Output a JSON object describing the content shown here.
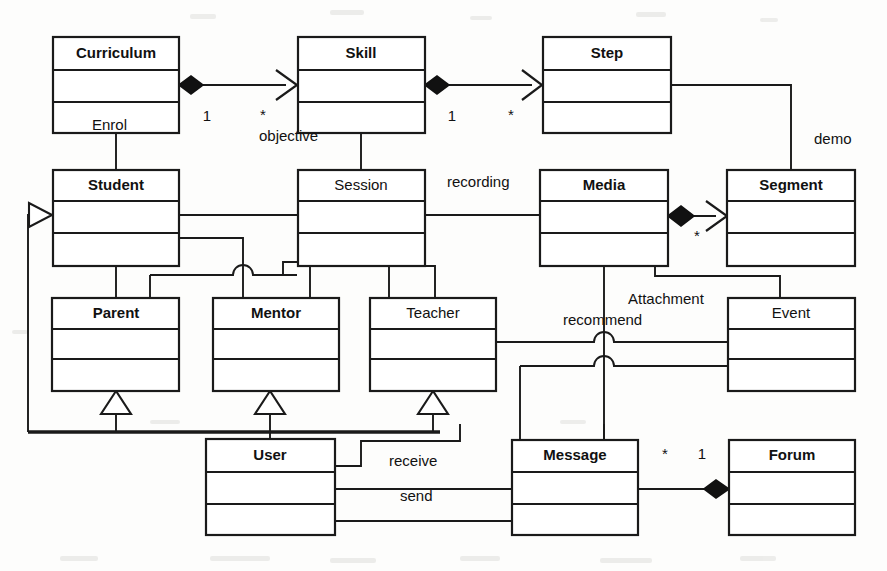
{
  "diagram": {
    "kind": "uml-class-diagram",
    "title": "",
    "canvas": {
      "width": 887,
      "height": 571
    },
    "colors": {
      "background": "#fdfdfc",
      "stroke": "#1a1a1a",
      "fill": "#ffffff",
      "text": "#111111"
    },
    "classes": [
      {
        "id": "curriculum",
        "name": "Curriculum",
        "bold": true,
        "x": 53,
        "y": 37,
        "w": 126,
        "h": 96
      },
      {
        "id": "skill",
        "name": "Skill",
        "bold": true,
        "x": 298,
        "y": 37,
        "w": 127,
        "h": 96
      },
      {
        "id": "step",
        "name": "Step",
        "bold": true,
        "x": 543,
        "y": 37,
        "w": 128,
        "h": 96
      },
      {
        "id": "student",
        "name": "Student",
        "bold": true,
        "x": 53,
        "y": 170,
        "w": 126,
        "h": 96
      },
      {
        "id": "session",
        "name": "Session",
        "bold": false,
        "x": 298,
        "y": 170,
        "w": 127,
        "h": 96
      },
      {
        "id": "media",
        "name": "Media",
        "bold": true,
        "x": 540,
        "y": 170,
        "w": 128,
        "h": 96
      },
      {
        "id": "segment",
        "name": "Segment",
        "bold": true,
        "x": 727,
        "y": 170,
        "w": 128,
        "h": 96
      },
      {
        "id": "parent",
        "name": "Parent",
        "bold": true,
        "x": 52,
        "y": 298,
        "w": 127,
        "h": 93
      },
      {
        "id": "mentor",
        "name": "Mentor",
        "bold": true,
        "x": 213,
        "y": 298,
        "w": 126,
        "h": 93
      },
      {
        "id": "teacher",
        "name": "Teacher",
        "bold": false,
        "x": 370,
        "y": 298,
        "w": 126,
        "h": 93
      },
      {
        "id": "event",
        "name": "Event",
        "bold": false,
        "x": 728,
        "y": 298,
        "w": 127,
        "h": 93
      },
      {
        "id": "user",
        "name": "User",
        "bold": true,
        "x": 206,
        "y": 439,
        "w": 129,
        "h": 96
      },
      {
        "id": "message",
        "name": "Message",
        "bold": true,
        "x": 512,
        "y": 440,
        "w": 126,
        "h": 95
      },
      {
        "id": "forum",
        "name": "Forum",
        "bold": true,
        "x": 729,
        "y": 440,
        "w": 126,
        "h": 95
      }
    ],
    "edge_labels": [
      {
        "id": "enrol",
        "text": "Enrol",
        "x": 92,
        "y": 126,
        "anchor": "start"
      },
      {
        "id": "objective",
        "text": "objective",
        "x": 259,
        "y": 137,
        "anchor": "start"
      },
      {
        "id": "recording",
        "text": "recording",
        "x": 447,
        "y": 183,
        "anchor": "start"
      },
      {
        "id": "demo",
        "text": "demo",
        "x": 814,
        "y": 140,
        "anchor": "start"
      },
      {
        "id": "attachment",
        "text": "Attachment",
        "x": 628,
        "y": 300,
        "anchor": "start"
      },
      {
        "id": "recommend",
        "text": "recommend",
        "x": 563,
        "y": 321,
        "anchor": "start"
      },
      {
        "id": "receive",
        "text": "receive",
        "x": 389,
        "y": 462,
        "anchor": "start"
      },
      {
        "id": "send",
        "text": "send",
        "x": 400,
        "y": 497,
        "anchor": "start"
      }
    ],
    "multiplicities": [
      {
        "id": "curriculum-skill-src",
        "text": "1",
        "x": 207,
        "y": 117
      },
      {
        "id": "curriculum-skill-tgt",
        "text": "*",
        "x": 263,
        "y": 116
      },
      {
        "id": "skill-step-src",
        "text": "1",
        "x": 452,
        "y": 117
      },
      {
        "id": "skill-step-tgt",
        "text": "*",
        "x": 511,
        "y": 116
      },
      {
        "id": "media-segment-tgt",
        "text": "*",
        "x": 697,
        "y": 237
      },
      {
        "id": "message-forum-src",
        "text": "*",
        "x": 665,
        "y": 455
      },
      {
        "id": "message-forum-tgt",
        "text": "1",
        "x": 702,
        "y": 455
      }
    ],
    "relations": [
      {
        "id": "curriculum-skill",
        "from": "curriculum",
        "to": "skill",
        "type": "aggregation-composition"
      },
      {
        "id": "skill-step",
        "from": "skill",
        "to": "step",
        "type": "aggregation-composition"
      },
      {
        "id": "media-segment",
        "from": "media",
        "to": "segment",
        "type": "aggregation-composition"
      },
      {
        "id": "message-forum",
        "from": "message",
        "to": "forum",
        "type": "aggregation-composition"
      },
      {
        "id": "curriculum-student",
        "from": "curriculum",
        "to": "student",
        "type": "association"
      },
      {
        "id": "skill-session",
        "from": "skill",
        "to": "session",
        "type": "association"
      },
      {
        "id": "student-session",
        "from": "student",
        "to": "session",
        "type": "association"
      },
      {
        "id": "session-media",
        "from": "session",
        "to": "media",
        "type": "association"
      },
      {
        "id": "step-segment",
        "from": "step",
        "to": "segment",
        "type": "association"
      },
      {
        "id": "student-parent",
        "from": "student",
        "to": "parent",
        "type": "association"
      },
      {
        "id": "student-mentor",
        "from": "student",
        "to": "mentor",
        "type": "association"
      },
      {
        "id": "session-mentor",
        "from": "session",
        "to": "mentor",
        "type": "association"
      },
      {
        "id": "session-teacher",
        "from": "session",
        "to": "teacher",
        "type": "association"
      },
      {
        "id": "media-event",
        "from": "media",
        "to": "event",
        "type": "association"
      },
      {
        "id": "media-message",
        "from": "media",
        "to": "message",
        "type": "association"
      },
      {
        "id": "teacher-event",
        "from": "teacher",
        "to": "event",
        "type": "association"
      },
      {
        "id": "parent-user",
        "from": "user",
        "to": "parent",
        "type": "generalization"
      },
      {
        "id": "mentor-user",
        "from": "user",
        "to": "mentor",
        "type": "generalization"
      },
      {
        "id": "teacher-user",
        "from": "user",
        "to": "teacher",
        "type": "generalization"
      },
      {
        "id": "user-student",
        "from": "user",
        "to": "student",
        "type": "navigable-association"
      },
      {
        "id": "user-message-receive",
        "from": "user",
        "to": "message",
        "type": "association"
      },
      {
        "id": "user-message-send",
        "from": "user",
        "to": "message",
        "type": "association"
      }
    ]
  }
}
